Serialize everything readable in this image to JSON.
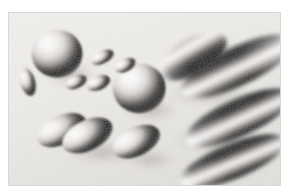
{
  "figure": {
    "medium": "grayscale airbrush rendering",
    "alt_text": "A grayscale rendering of spheres and elongated ellipsoids floating in space, lit from the upper left, casting soft shading and shadows.",
    "canvas": {
      "width": 289,
      "height": 196,
      "background_color": "#ffffff"
    },
    "plate": {
      "x": 8,
      "y": 12,
      "width": 273,
      "height": 174,
      "paper_color": "#f2f0ee",
      "paper_color_2": "#e8e6e3",
      "border_color": "#d9d6d2"
    },
    "palette": {
      "highlight": "#fdfdfd",
      "light": "#e2e0dd",
      "mid": "#9a9794",
      "dark": "#3b3a39",
      "deepest": "#111111",
      "shadow": "#b9b6b2"
    },
    "lighting": {
      "direction": "upper-left",
      "highlight_offset_x": -0.3,
      "highlight_offset_y": -0.35
    },
    "objects": [
      {
        "name": "sphere-upper-left",
        "shape": "sphere",
        "cx": 52,
        "cy": 47,
        "rx": 27,
        "ry": 27,
        "rotation": 0
      },
      {
        "name": "sphere-center",
        "shape": "sphere",
        "cx": 139,
        "cy": 86,
        "rx": 28,
        "ry": 28,
        "rotation": 0
      },
      {
        "name": "ellipse-far-left-small",
        "shape": "ellipsoid",
        "cx": 21,
        "cy": 79,
        "rx": 8,
        "ry": 16,
        "rotation": -15
      },
      {
        "name": "ellipse-cluster-a",
        "shape": "ellipsoid",
        "cx": 100,
        "cy": 51,
        "rx": 13,
        "ry": 7,
        "rotation": -28
      },
      {
        "name": "ellipse-cluster-b",
        "shape": "ellipsoid",
        "cx": 124,
        "cy": 60,
        "rx": 12,
        "ry": 7,
        "rotation": -28
      },
      {
        "name": "ellipse-cluster-c",
        "shape": "ellipsoid",
        "cx": 72,
        "cy": 79,
        "rx": 12,
        "ry": 7,
        "rotation": -25
      },
      {
        "name": "ellipse-cluster-d",
        "shape": "ellipsoid",
        "cx": 96,
        "cy": 80,
        "rx": 13,
        "ry": 8,
        "rotation": -25
      },
      {
        "name": "ellipse-lower-left-back",
        "shape": "ellipsoid",
        "cx": 57,
        "cy": 133,
        "rx": 28,
        "ry": 16,
        "rotation": -28
      },
      {
        "name": "ellipse-lower-left-front",
        "shape": "ellipsoid",
        "cx": 84,
        "cy": 139,
        "rx": 29,
        "ry": 17,
        "rotation": -28
      },
      {
        "name": "ellipse-lower-center",
        "shape": "ellipsoid",
        "cx": 136,
        "cy": 146,
        "rx": 27,
        "ry": 16,
        "rotation": -28
      },
      {
        "name": "ellipsoid-upper-right-short",
        "shape": "ellipsoid",
        "cx": 196,
        "cy": 50,
        "rx": 40,
        "ry": 20,
        "rotation": -32
      },
      {
        "name": "ellipsoid-right-long-top",
        "shape": "ellipsoid",
        "cx": 243,
        "cy": 61,
        "rx": 66,
        "ry": 22,
        "rotation": -27
      },
      {
        "name": "ellipsoid-right-long-mid",
        "shape": "ellipsoid",
        "cx": 244,
        "cy": 119,
        "rx": 62,
        "ry": 21,
        "rotation": -26
      },
      {
        "name": "ellipsoid-right-long-bottom",
        "shape": "ellipsoid",
        "cx": 238,
        "cy": 168,
        "rx": 60,
        "ry": 20,
        "rotation": -24
      }
    ]
  }
}
